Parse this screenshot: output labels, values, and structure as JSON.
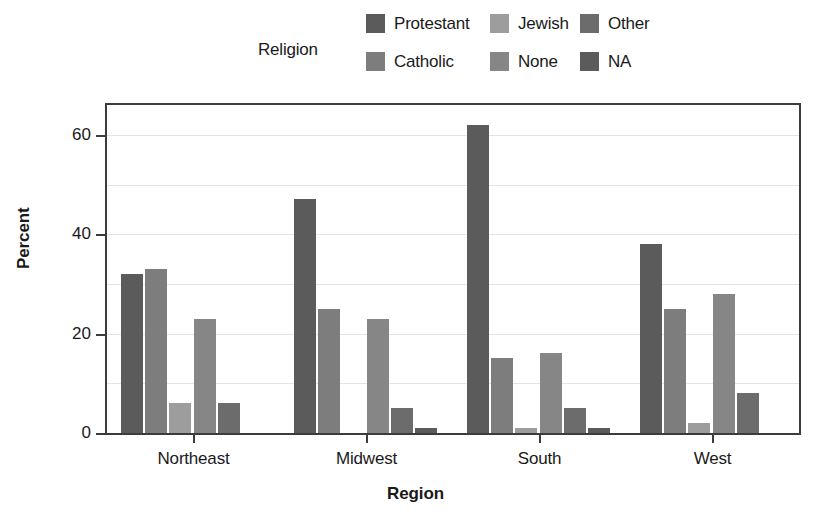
{
  "chart_data": {
    "type": "bar",
    "title": "",
    "subtitle": "",
    "xlabel": "Region",
    "ylabel": "Percent",
    "categories": [
      "Northeast",
      "Midwest",
      "South",
      "West"
    ],
    "series": [
      {
        "name": "Protestant",
        "color": "#5b5b5b",
        "values": [
          32,
          47,
          62,
          38
        ]
      },
      {
        "name": "Catholic",
        "color": "#7d7d7d",
        "values": [
          33,
          25,
          15,
          25
        ]
      },
      {
        "name": "Jewish",
        "color": "#9d9d9d",
        "values": [
          6,
          0,
          1,
          2
        ]
      },
      {
        "name": "None",
        "color": "#868686",
        "values": [
          23,
          23,
          16,
          28
        ]
      },
      {
        "name": "Other",
        "color": "#6c6c6c",
        "values": [
          6,
          5,
          5,
          8
        ]
      },
      {
        "name": "NA",
        "color": "#5b5b5b",
        "values": [
          0,
          1,
          1,
          0
        ]
      }
    ],
    "legend_title": "Religion",
    "legend_position": "top",
    "ylim": [
      0,
      66
    ],
    "yticks": [
      0,
      20,
      40,
      60
    ],
    "ytick_labels": [
      "0",
      "20",
      "40",
      "60"
    ],
    "minor_gridlines": [
      10,
      30,
      50
    ],
    "grid": true,
    "grid_color": "#e4e4e4",
    "axis_color": "#3c3c3c",
    "background": "#ffffff"
  },
  "legend": {
    "title": "Religion",
    "entries": [
      {
        "label": "Protestant",
        "color": "#5b5b5b"
      },
      {
        "label": "Catholic",
        "color": "#7d7d7d"
      },
      {
        "label": "Jewish",
        "color": "#9d9d9d"
      },
      {
        "label": "None",
        "color": "#868686"
      },
      {
        "label": "Other",
        "color": "#6c6c6c"
      },
      {
        "label": "NA",
        "color": "#5b5b5b"
      }
    ]
  },
  "axes": {
    "y_title": "Percent",
    "x_title": "Region"
  }
}
